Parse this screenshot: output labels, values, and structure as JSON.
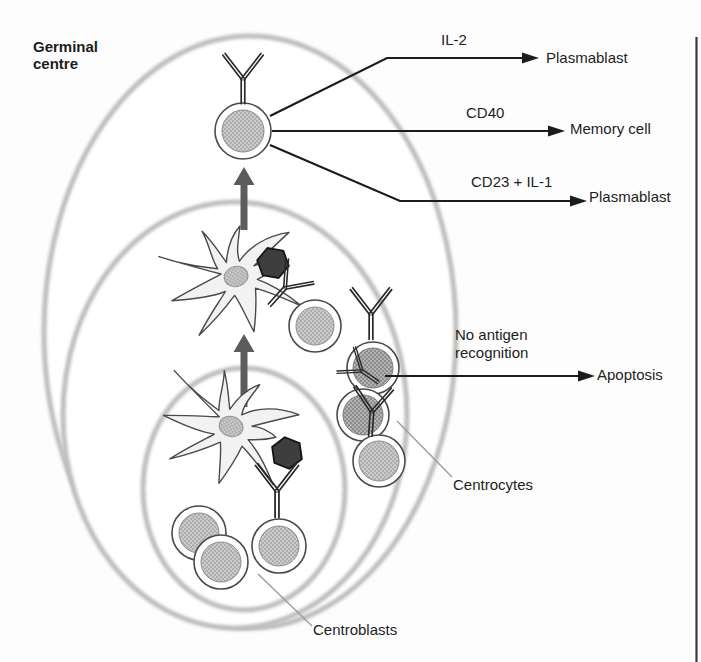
{
  "figure": {
    "region_label": "Germinal centre",
    "pathways": [
      {
        "signal": "IL-2",
        "outcome": "Plasmablast"
      },
      {
        "signal": "CD40",
        "outcome": "Memory cell"
      },
      {
        "signal": "CD23 + IL-1",
        "outcome": "Plasmablast"
      },
      {
        "signal": "No antigen recognition",
        "outcome": "Apoptosis"
      }
    ],
    "cell_labels": {
      "centrocytes": "Centrocytes",
      "centroblasts": "Centroblasts"
    },
    "colors": {
      "pathway_line": "#1c1c1c",
      "differentiation_arrow": "#5c5c5c",
      "zone_halo": "#bdbdbd",
      "antigen_hexagon": "#3e3e3e",
      "cell_nucleus_light": "#cbcbcb",
      "cell_nucleus_dark": "#b2b2b2",
      "fdc_body": "#f2f2f2"
    }
  }
}
